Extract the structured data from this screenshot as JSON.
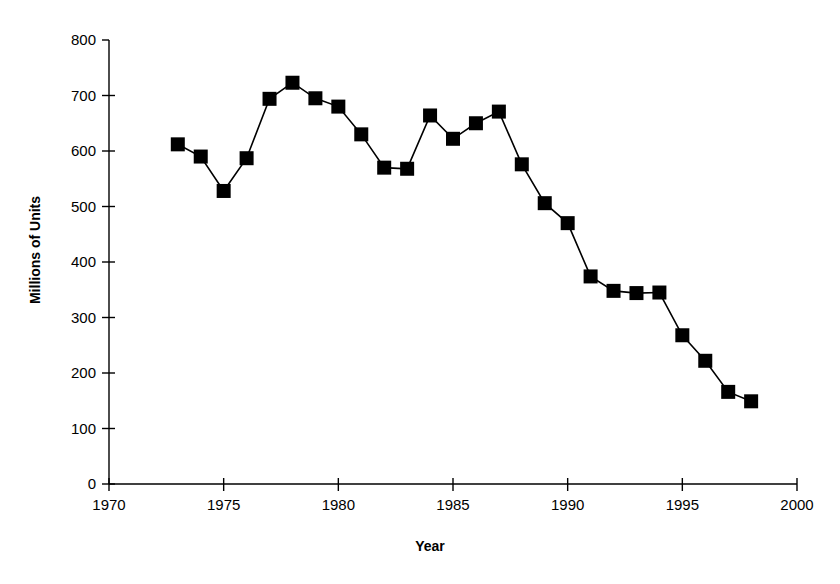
{
  "chart_data": {
    "type": "line",
    "title": "",
    "xlabel": "Year",
    "ylabel": "Millions of Units",
    "xlim": [
      1970,
      2000
    ],
    "ylim": [
      0,
      800
    ],
    "xticks": [
      1970,
      1975,
      1980,
      1985,
      1990,
      1995,
      2000
    ],
    "yticks": [
      0,
      100,
      200,
      300,
      400,
      500,
      600,
      700,
      800
    ],
    "grid": false,
    "legend": null,
    "marker": "square",
    "marker_color": "#000000",
    "line_color": "#000000",
    "x": [
      1973,
      1974,
      1975,
      1976,
      1977,
      1978,
      1979,
      1980,
      1981,
      1982,
      1983,
      1984,
      1985,
      1986,
      1987,
      1988,
      1989,
      1990,
      1991,
      1992,
      1993,
      1994,
      1995,
      1996,
      1997,
      1998
    ],
    "values": [
      612,
      590,
      528,
      587,
      694,
      723,
      695,
      680,
      630,
      570,
      568,
      664,
      622,
      650,
      671,
      576,
      506,
      470,
      374,
      348,
      344,
      345,
      268,
      222,
      166,
      149
    ],
    "series": [
      {
        "name": "Millions of Units",
        "values": [
          612,
          590,
          528,
          587,
          694,
          723,
          695,
          680,
          630,
          570,
          568,
          664,
          622,
          650,
          671,
          576,
          506,
          470,
          374,
          348,
          344,
          345,
          268,
          222,
          166,
          149
        ]
      }
    ]
  },
  "axes": {
    "y_tick_labels": [
      "800",
      "700",
      "600",
      "500",
      "400",
      "300",
      "200",
      "100",
      "0"
    ],
    "x_tick_labels": [
      "1970",
      "1975",
      "1980",
      "1985",
      "1990",
      "1995",
      "2000"
    ],
    "y_title": "Millions of Units",
    "x_title": "Year"
  }
}
